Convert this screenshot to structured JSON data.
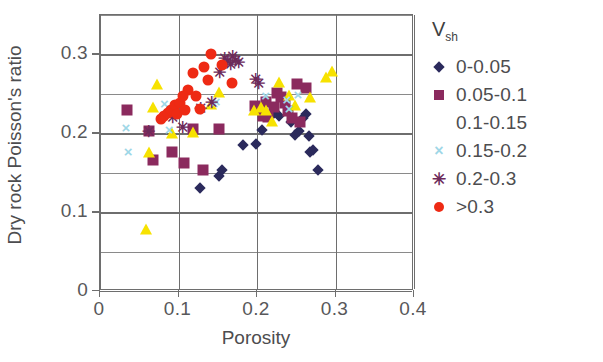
{
  "chart_data": {
    "type": "scatter",
    "title": "",
    "xlabel": "Porosity",
    "ylabel": "Dry rock Poisson's ratio",
    "xlim": [
      0,
      0.4
    ],
    "ylim": [
      0,
      0.35
    ],
    "xticks": [
      "0",
      "0.1",
      "0.2",
      "0.3",
      "0.4"
    ],
    "xtick_values": [
      0,
      0.1,
      0.2,
      0.3,
      0.4
    ],
    "yticks": [
      "0",
      "0.1",
      "0.2",
      "0.3"
    ],
    "ytick_values": [
      0,
      0.1,
      0.2,
      0.3
    ],
    "minor_gridlines": true,
    "grid": true,
    "legend_position": "right",
    "legend_title": "Vsh",
    "legend_title_base": "V",
    "legend_title_sub": "sh",
    "series": [
      {
        "name": "0-0.05",
        "marker": "diamond",
        "color": "#2b2a5c",
        "points": [
          [
            0.128,
            0.131
          ],
          [
            0.152,
            0.146
          ],
          [
            0.155,
            0.154
          ],
          [
            0.182,
            0.185
          ],
          [
            0.199,
            0.186
          ],
          [
            0.206,
            0.204
          ],
          [
            0.222,
            0.226
          ],
          [
            0.228,
            0.222
          ],
          [
            0.254,
            0.203
          ],
          [
            0.258,
            0.219
          ],
          [
            0.262,
            0.224
          ],
          [
            0.266,
            0.196
          ],
          [
            0.268,
            0.176
          ],
          [
            0.271,
            0.179
          ],
          [
            0.278,
            0.154
          ],
          [
            0.243,
            0.214
          ],
          [
            0.249,
            0.198
          ]
        ]
      },
      {
        "name": "0.05-0.1",
        "marker": "square",
        "color": "#8b2a5e",
        "points": [
          [
            0.035,
            0.229
          ],
          [
            0.062,
            0.203
          ],
          [
            0.068,
            0.166
          ],
          [
            0.092,
            0.176
          ],
          [
            0.107,
            0.162
          ],
          [
            0.118,
            0.206
          ],
          [
            0.131,
            0.153
          ],
          [
            0.152,
            0.205
          ],
          [
            0.197,
            0.234
          ],
          [
            0.204,
            0.232
          ],
          [
            0.208,
            0.222
          ],
          [
            0.214,
            0.221
          ],
          [
            0.222,
            0.233
          ],
          [
            0.226,
            0.251
          ],
          [
            0.231,
            0.246
          ],
          [
            0.236,
            0.239
          ],
          [
            0.239,
            0.228
          ],
          [
            0.244,
            0.219
          ],
          [
            0.251,
            0.262
          ],
          [
            0.255,
            0.214
          ],
          [
            0.262,
            0.258
          ],
          [
            0.212,
            0.24
          ]
        ]
      },
      {
        "name": "0.1-0.15",
        "marker": "triangle",
        "color": "#f7e200",
        "points": [
          [
            0.058,
            0.079
          ],
          [
            0.062,
            0.176
          ],
          [
            0.068,
            0.233
          ],
          [
            0.072,
            0.263
          ],
          [
            0.092,
            0.2
          ],
          [
            0.118,
            0.201
          ],
          [
            0.141,
            0.237
          ],
          [
            0.152,
            0.252
          ],
          [
            0.196,
            0.229
          ],
          [
            0.205,
            0.233
          ],
          [
            0.212,
            0.229
          ],
          [
            0.219,
            0.216
          ],
          [
            0.228,
            0.265
          ],
          [
            0.241,
            0.249
          ],
          [
            0.248,
            0.236
          ],
          [
            0.268,
            0.246
          ],
          [
            0.296,
            0.279
          ],
          [
            0.288,
            0.272
          ]
        ]
      },
      {
        "name": "0.15-0.2",
        "marker": "cross",
        "color": "#9fd7e7",
        "points": [
          [
            0.033,
            0.208
          ],
          [
            0.036,
            0.178
          ],
          [
            0.082,
            0.239
          ],
          [
            0.088,
            0.206
          ],
          [
            0.145,
            0.239
          ],
          [
            0.148,
            0.241
          ],
          [
            0.211,
            0.248
          ],
          [
            0.238,
            0.244
          ],
          [
            0.241,
            0.232
          ],
          [
            0.252,
            0.25
          ]
        ]
      },
      {
        "name": "0.2-0.3",
        "marker": "star",
        "color": "#6d2a5a",
        "points": [
          [
            0.062,
            0.202
          ],
          [
            0.092,
            0.219
          ],
          [
            0.105,
            0.207
          ],
          [
            0.128,
            0.231
          ],
          [
            0.142,
            0.239
          ],
          [
            0.152,
            0.276
          ],
          [
            0.158,
            0.294
          ],
          [
            0.162,
            0.291
          ],
          [
            0.166,
            0.286
          ],
          [
            0.169,
            0.297
          ],
          [
            0.172,
            0.292
          ],
          [
            0.176,
            0.289
          ],
          [
            0.198,
            0.268
          ],
          [
            0.202,
            0.262
          ]
        ]
      },
      {
        "name": ">0.3",
        "marker": "circle",
        "color": "#ee2a14",
        "points": [
          [
            0.078,
            0.218
          ],
          [
            0.082,
            0.222
          ],
          [
            0.086,
            0.226
          ],
          [
            0.091,
            0.23
          ],
          [
            0.095,
            0.236
          ],
          [
            0.098,
            0.224
          ],
          [
            0.102,
            0.238
          ],
          [
            0.108,
            0.229
          ],
          [
            0.112,
            0.255
          ],
          [
            0.118,
            0.276
          ],
          [
            0.122,
            0.247
          ],
          [
            0.128,
            0.231
          ],
          [
            0.132,
            0.284
          ],
          [
            0.138,
            0.267
          ],
          [
            0.142,
            0.301
          ],
          [
            0.155,
            0.287
          ],
          [
            0.168,
            0.264
          ],
          [
            0.106,
            0.247
          ]
        ]
      }
    ],
    "legend_entries": [
      {
        "label": "0-0.05",
        "marker": "diamond",
        "color": "#2b2a5c"
      },
      {
        "label": "0.05-0.1",
        "marker": "square",
        "color": "#8b2a5e"
      },
      {
        "label": "0.1-0.15",
        "marker": "triangle",
        "color": "#f7e200"
      },
      {
        "label": "0.15-0.2",
        "marker": "cross",
        "color": "#9fd7e7"
      },
      {
        "label": "0.2-0.3",
        "marker": "star",
        "color": "#6d2a5a"
      },
      {
        "label": ">0.3",
        "marker": "circle",
        "color": "#ee2a14"
      }
    ]
  }
}
